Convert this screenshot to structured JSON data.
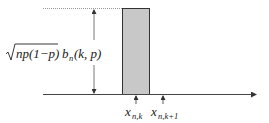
{
  "diagram": {
    "bar_height_label": {
      "radical": "√",
      "radicand": "np(1−p)",
      "factor_base": "b",
      "factor_sub": "n",
      "factor_args": "(k, p)"
    },
    "tick_labels": [
      {
        "base": "x",
        "sub": "n,k"
      },
      {
        "base": "x",
        "sub": "n,k+1"
      }
    ],
    "colors": {
      "bar_fill": "#c8c8c8",
      "bar_stroke": "#333333",
      "axis": "#444444",
      "dotted_guide": "#9a9a9a",
      "text": "#222222"
    }
  }
}
